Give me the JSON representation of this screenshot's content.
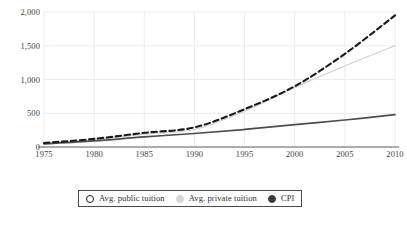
{
  "chart_data": {
    "type": "line",
    "title": "",
    "subtitle": "",
    "xlabel": "",
    "ylabel": "",
    "xlim": [
      1975,
      2010
    ],
    "ylim": [
      0,
      2000
    ],
    "grid": true,
    "legend_position": "bottom",
    "x_tick_labels": [
      "1975",
      "1980",
      "1985",
      "1990",
      "1995",
      "2000",
      "2005",
      "2010"
    ],
    "x_ticks": [
      1975,
      1980,
      1985,
      1990,
      1995,
      2000,
      2005,
      2010
    ],
    "y_tick_labels": [
      "0",
      "500",
      "1,000",
      "1,500",
      "2,000"
    ],
    "y_ticks": [
      0,
      500,
      1000,
      1500,
      2000
    ],
    "x": [
      1975,
      1980,
      1985,
      1990,
      1995,
      2000,
      2005,
      2010
    ],
    "series": [
      {
        "name": "Avg. public tuition",
        "style": "dashed",
        "color": "#1a1a1a",
        "marker": "open-circle",
        "values": [
          60,
          120,
          210,
          290,
          560,
          900,
          1380,
          1950
        ]
      },
      {
        "name": "Avg. private tuition",
        "style": "solid-thin",
        "color": "#cfcfcf",
        "marker": "filled-circle-light",
        "values": [
          50,
          105,
          190,
          260,
          530,
          880,
          1200,
          1500
        ]
      },
      {
        "name": "CPI",
        "style": "solid",
        "color": "#4d4d4d",
        "marker": "filled-circle-dark",
        "values": [
          45,
          90,
          150,
          200,
          260,
          330,
          400,
          480
        ]
      }
    ]
  },
  "legend": {
    "entries": [
      {
        "label": "Avg. public tuition",
        "marker": "open-circle-icon"
      },
      {
        "label": "Avg. private tuition",
        "marker": "light-circle-icon"
      },
      {
        "label": "CPI",
        "marker": "dark-circle-icon"
      }
    ]
  },
  "caption": {
    "text": "",
    "note": "clipped"
  }
}
